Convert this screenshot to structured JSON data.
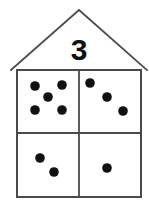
{
  "figure": {
    "roof": {
      "number_label": "3",
      "apex": {
        "x": 79,
        "y": 10
      },
      "left_eave": {
        "x": 11,
        "y": 70
      },
      "right_eave": {
        "x": 147,
        "y": 70
      },
      "number_position": {
        "x": 79,
        "y": 60
      }
    },
    "body": {
      "x": 17,
      "y": 70,
      "width": 124,
      "height": 127,
      "divider_vertical_x": 79,
      "divider_horizontal_y": 133
    },
    "colors": {
      "outline": "#4a4a4a",
      "pip": "#111111",
      "number": "#101010",
      "background": "#ffffff"
    }
  },
  "chart_data": {
    "type": "diagram",
    "roof_number": 3,
    "quadrants": [
      {
        "name": "top-left",
        "count": 5,
        "pattern": "dice-five",
        "pips": [
          {
            "cx": 35,
            "cy": 86,
            "r": 4.8
          },
          {
            "cx": 62,
            "cy": 85,
            "r": 4.8
          },
          {
            "cx": 48,
            "cy": 97,
            "r": 4.8
          },
          {
            "cx": 35,
            "cy": 110,
            "r": 4.8
          },
          {
            "cx": 62,
            "cy": 110,
            "r": 4.8
          }
        ]
      },
      {
        "name": "top-right",
        "count": 3,
        "pattern": "diagonal-three",
        "pips": [
          {
            "cx": 90,
            "cy": 83,
            "r": 4.8
          },
          {
            "cx": 107,
            "cy": 97,
            "r": 4.8
          },
          {
            "cx": 123,
            "cy": 111,
            "r": 4.8
          }
        ]
      },
      {
        "name": "bottom-left",
        "count": 2,
        "pattern": "diagonal-two",
        "pips": [
          {
            "cx": 40,
            "cy": 158,
            "r": 4.8
          },
          {
            "cx": 54,
            "cy": 172,
            "r": 4.8
          }
        ]
      },
      {
        "name": "bottom-right",
        "count": 1,
        "pattern": "single-center",
        "pips": [
          {
            "cx": 107,
            "cy": 168,
            "r": 4.8
          }
        ]
      }
    ]
  }
}
